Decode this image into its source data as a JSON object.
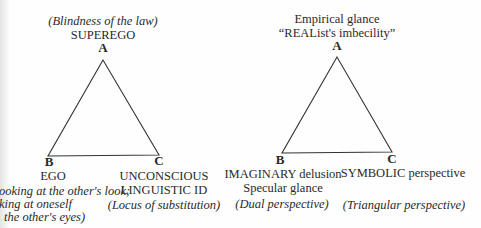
{
  "left_diagram": {
    "apex": {
      "vertex": "A",
      "lines": [
        "(Blindness of the law)",
        "SUPEREGO"
      ]
    },
    "bottom_left": {
      "vertex": "B",
      "lines": [
        "EGO",
        "ooking at the other's look;",
        "king at oneself",
        "the other's eyes)"
      ]
    },
    "bottom_right": {
      "vertex": "C",
      "lines": [
        "UNCONSCIOUS",
        "LINGUISTIC ID",
        "(Locus of substitution)"
      ]
    }
  },
  "right_diagram": {
    "apex": {
      "vertex": "A",
      "lines": [
        "Empirical glance",
        "“REAList's imbecility”"
      ]
    },
    "bottom_left": {
      "vertex": "B",
      "lines": [
        "IMAGINARY delusion",
        "Specular glance",
        "(Dual perspective)"
      ]
    },
    "bottom_right": {
      "vertex": "C",
      "lines": [
        "SYMBOLIC perspective",
        "(Triangular perspective)"
      ]
    }
  }
}
